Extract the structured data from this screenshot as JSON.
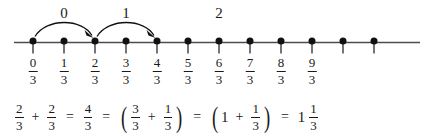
{
  "figure": {
    "ink_color": "#1a1a1a",
    "line_color": "#4d4d4d",
    "background": "#ffffff"
  },
  "numberline": {
    "denominator": "3",
    "dot_count": 12,
    "labels": [
      {
        "numerator": "0",
        "denominator": "3"
      },
      {
        "numerator": "1",
        "denominator": "3"
      },
      {
        "numerator": "2",
        "denominator": "3"
      },
      {
        "numerator": "3",
        "denominator": "3"
      },
      {
        "numerator": "4",
        "denominator": "3"
      },
      {
        "numerator": "5",
        "denominator": "3"
      },
      {
        "numerator": "6",
        "denominator": "3"
      },
      {
        "numerator": "7",
        "denominator": "3"
      },
      {
        "numerator": "8",
        "denominator": "3"
      },
      {
        "numerator": "9",
        "denominator": "3"
      }
    ],
    "jumps": [
      {
        "label": "0",
        "from_index": 0,
        "to_index": 2
      },
      {
        "label": "1",
        "from_index": 2,
        "to_index": 4
      }
    ],
    "marks": [
      {
        "label": "2",
        "at_index": 6
      }
    ]
  },
  "equation": {
    "terms": [
      {
        "kind": "fraction",
        "numerator": "2",
        "denominator": "3"
      },
      {
        "kind": "operator",
        "text": "+"
      },
      {
        "kind": "fraction",
        "numerator": "2",
        "denominator": "3"
      },
      {
        "kind": "operator",
        "text": "="
      },
      {
        "kind": "fraction",
        "numerator": "4",
        "denominator": "3"
      },
      {
        "kind": "operator",
        "text": "="
      },
      {
        "kind": "group",
        "open": "(",
        "close": ")",
        "items": [
          {
            "kind": "fraction",
            "numerator": "3",
            "denominator": "3"
          },
          {
            "kind": "operator",
            "text": "+"
          },
          {
            "kind": "fraction",
            "numerator": "1",
            "denominator": "3"
          }
        ]
      },
      {
        "kind": "operator",
        "text": "="
      },
      {
        "kind": "group",
        "open": "(",
        "close": ")",
        "items": [
          {
            "kind": "number",
            "text": "1"
          },
          {
            "kind": "operator",
            "text": "+"
          },
          {
            "kind": "fraction",
            "numerator": "1",
            "denominator": "3"
          }
        ]
      },
      {
        "kind": "operator",
        "text": "="
      },
      {
        "kind": "mixed",
        "whole": "1",
        "numerator": "1",
        "denominator": "3"
      }
    ]
  }
}
